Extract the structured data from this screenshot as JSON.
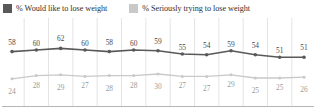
{
  "legend": {
    "entries": [
      {
        "label": "% Would like to lose weight",
        "color": "#595959",
        "icon": "legend-swatch-icon"
      },
      {
        "label": "% Seriously trying to lose weight",
        "color": "#c9c9c9",
        "icon": "legend-swatch-icon"
      }
    ]
  },
  "chart_data": {
    "type": "line",
    "title": "",
    "subtitle": "",
    "xlabel": "",
    "ylabel": "",
    "grid": true,
    "legend_position": "top-left",
    "ylim": [
      0,
      70
    ],
    "categories": [
      "",
      "",
      "",
      "",
      "",
      "",
      "",
      "",
      "",
      "",
      "",
      "",
      ""
    ],
    "series": [
      {
        "name": "% Would like to lose weight",
        "color": "#595959",
        "values": [
          58,
          60,
          62,
          60,
          58,
          60,
          59,
          55,
          54,
          59,
          54,
          51,
          51
        ]
      },
      {
        "name": "% Seriously trying to lose weight",
        "color": "#c9c9c9",
        "values": [
          24,
          28,
          29,
          27,
          28,
          28,
          30,
          27,
          27,
          29,
          25,
          25,
          26
        ]
      }
    ]
  },
  "axis": {
    "baseline_color": "#b5b5b5",
    "gridline_color": "#d8d8d8"
  }
}
